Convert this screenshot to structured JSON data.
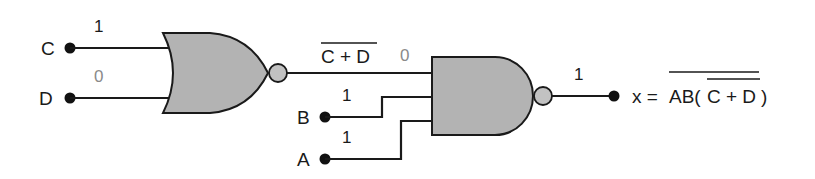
{
  "diagram": {
    "type": "logic-circuit",
    "inputs": [
      {
        "name": "C",
        "value": "1"
      },
      {
        "name": "D",
        "value": "0"
      },
      {
        "name": "B",
        "value": "1"
      },
      {
        "name": "A",
        "value": "1"
      }
    ],
    "gates": [
      {
        "type": "NOR",
        "inputs": [
          "C",
          "D"
        ],
        "output_label": "C + D",
        "output_label_overbar": true,
        "output_value": "0"
      },
      {
        "type": "NAND",
        "inputs": [
          "C + D (complemented)",
          "B",
          "A"
        ],
        "output_value": "1"
      }
    ],
    "output": {
      "prefix": "x = ",
      "expression_outer": "AB(",
      "expression_inner": "C + D",
      "expression_close": ")",
      "full": "x = AB(C+D) with overbar on whole product and on C+D"
    }
  },
  "labels": {
    "C": "C",
    "D": "D",
    "B": "B",
    "A": "A",
    "c_val": "1",
    "d_val": "0",
    "b_val": "1",
    "a_val": "1",
    "nor_out_expr": "C + D",
    "nor_out_val": "0",
    "nand_out_val": "1",
    "x_prefix": "x = ",
    "x_ab": "AB(",
    "x_inner": "C + D",
    "x_close": ")"
  },
  "colors": {
    "gate_fill": "#b3b3b3",
    "bubble_fill": "#c2c2c2",
    "line": "#1a1a1a",
    "zero_value_text": "#8a8a8a"
  }
}
